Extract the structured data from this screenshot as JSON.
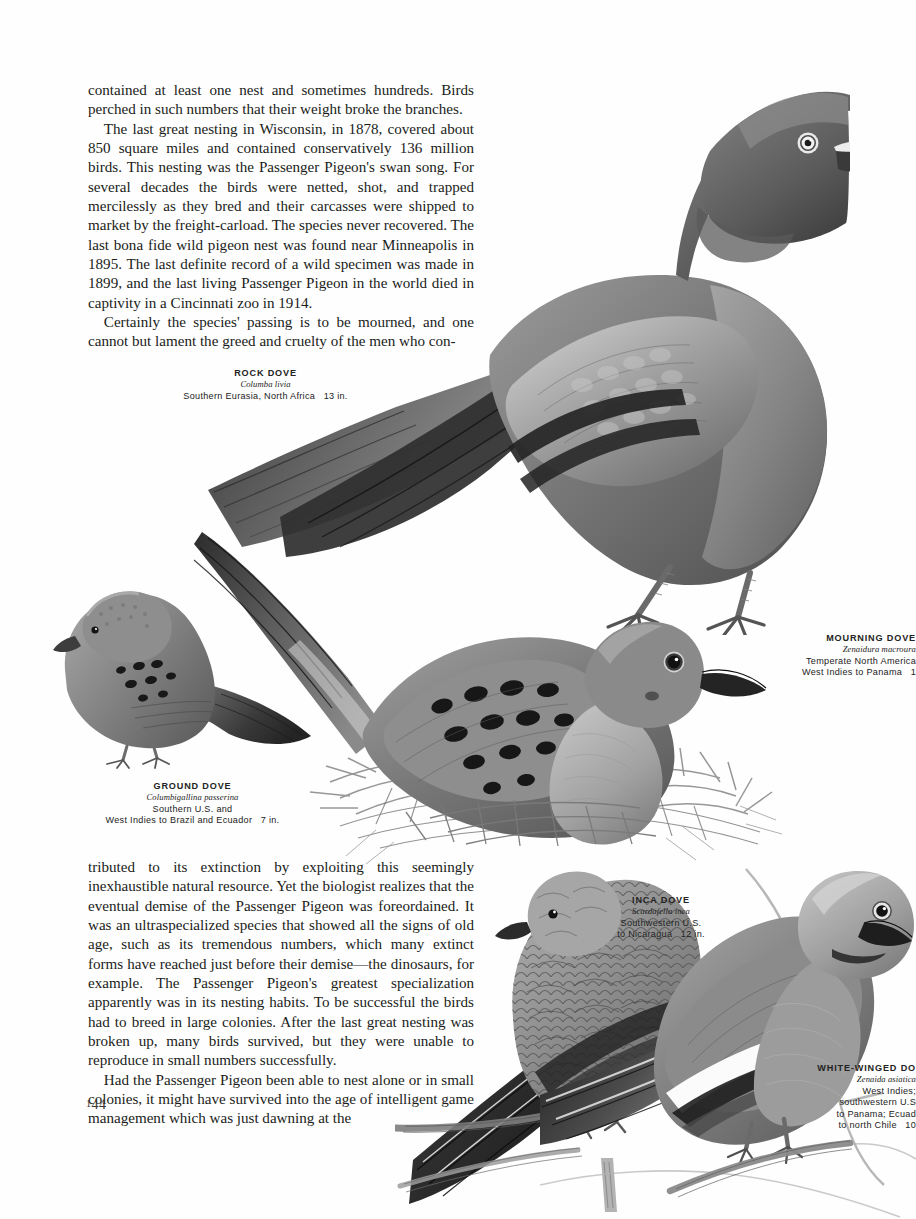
{
  "page": {
    "folio_prefix": "1",
    "folio": "44",
    "background_color": "#fefefe",
    "ink_color": "#201c19"
  },
  "text_top": {
    "paragraphs": [
      {
        "indent": false,
        "text": "contained at least one nest and sometimes hundreds. Birds perched in such numbers that their weight broke the branches."
      },
      {
        "indent": true,
        "text": "The last great nesting in Wisconsin, in 1878, covered about 850 square miles and contained conservatively 136 million birds. This nesting was the Passenger Pigeon's swan song. For several decades the birds were netted, shot, and trapped mercilessly as they bred and their carcasses were shipped to market by the freight-carload. The species never recovered. The last bona fide wild pigeon nest was found near Minneapolis in 1895. The last definite record of a wild specimen was made in 1899, and the last living Passenger Pigeon in the world died in captivity in a Cincinnati zoo in 1914."
      },
      {
        "indent": true,
        "text": "Certainly the species' passing is to be mourned, and one cannot but lament the greed and cruelty of the men who con-"
      }
    ]
  },
  "text_bottom": {
    "paragraphs": [
      {
        "indent": false,
        "text": "tributed to its extinction by exploiting this seemingly inexhaustible natural resource. Yet the biologist realizes that the eventual demise of the Passenger Pigeon was foreordained. It was an ultraspecialized species that showed all the signs of old age, such as its tremendous numbers, which many extinct forms have reached just before their demise—the dinosaurs, for example. The Passenger Pigeon's greatest specialization apparently was in its nesting habits. To be successful the birds had to breed in large colonies. After the last great nesting was broken up, many birds survived, but they were unable to reproduce in small numbers successfully."
      },
      {
        "indent": true,
        "text": "Had the Passenger Pigeon been able to nest alone or in small colonies, it might have survived into the age of intelligent game management which was just dawning at the"
      }
    ]
  },
  "captions": {
    "rock_dove": {
      "name": "ROCK DOVE",
      "latin": "Columba livia",
      "range": "Southern Eurasia, North Africa",
      "size": "13 in."
    },
    "ground_dove": {
      "name": "GROUND DOVE",
      "latin": "Columbigallina passerina",
      "range_line1": "Southern U.S. and",
      "range_line2": "West Indies to Brazil and Ecuador",
      "size": "7 in."
    },
    "mourning_dove": {
      "name": "MOURNING DOVE",
      "latin": "Zenaidura macroura",
      "range_line1": "Temperate North America",
      "range_line2": "West Indies to Panama",
      "size": "1"
    },
    "inca_dove": {
      "name": "INCA DOVE",
      "latin": "Scardafella inca",
      "range_line1": "Southwestern U.S.",
      "range_line2": "to Nicaragua",
      "size": "12 in."
    },
    "white_winged_dove": {
      "name": "WHITE-WINGED DO",
      "latin": "Zenaida asiatica",
      "range_line1": "West Indies;",
      "range_line2": "southwestern U.S",
      "range_line3": "to Panama; Ecuad",
      "range_line4": "to north Chile",
      "size": "10"
    }
  },
  "illustrations": [
    {
      "label": "rock-dove-illustration",
      "subject": "Rock Dove standing, right-facing, full body"
    },
    {
      "label": "ground-dove-illustration",
      "subject": "Ground Dove standing, left-facing small dove"
    },
    {
      "label": "mourning-dove-nest-illustration",
      "subject": "Mourning Dove sitting on twig nest with long pointed tail"
    },
    {
      "label": "inca-dove-illustration",
      "subject": "Inca Dove perched on branch, scaled plumage"
    },
    {
      "label": "white-winged-dove-illustration",
      "subject": "White-winged Dove perched on branch with white wing bar"
    }
  ]
}
